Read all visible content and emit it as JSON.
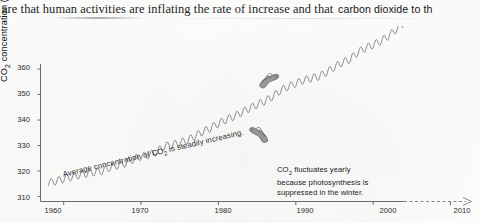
{
  "page": {
    "top_text_serif": "are that human activities are inflating the rate of increase and that",
    "top_text_sans": "carbon dioxide to th"
  },
  "chart_data": {
    "type": "line",
    "title": "",
    "xlabel": "",
    "ylabel": "CO2 concentration (parts per million)",
    "ylabel_main": "CO",
    "ylabel_sub": "2",
    "ylabel_rest": " concentration (parts per million)",
    "xlim": [
      1957,
      2012
    ],
    "ylim": [
      308,
      362
    ],
    "xticks": [
      "1960",
      "1970",
      "1980",
      "1990",
      "2000",
      "2010"
    ],
    "xtick_values": [
      1960,
      1970,
      1980,
      1990,
      2000,
      2010
    ],
    "yticks": [
      "310",
      "320",
      "330",
      "340",
      "350",
      "360"
    ],
    "ytick_values": [
      310,
      320,
      330,
      340,
      350,
      360
    ],
    "grid": false,
    "legend": "none",
    "line_color": "#8d8d8d",
    "axis_color": "#6f6f6f",
    "series": [
      {
        "name": "Mauna Loa CO2 (monthly, observed)",
        "x": [
          1958,
          1959,
          1960,
          1961,
          1962,
          1963,
          1964,
          1965,
          1966,
          1967,
          1968,
          1969,
          1970,
          1971,
          1972,
          1973,
          1974,
          1975,
          1976,
          1977,
          1978,
          1979,
          1980,
          1981,
          1982,
          1983,
          1984,
          1985,
          1986,
          1987,
          1988,
          1989,
          1990,
          1991,
          1992,
          1993,
          1994,
          1995,
          1996,
          1997,
          1998,
          1999,
          2000,
          2001,
          2002,
          2003
        ],
        "values": [
          315.3,
          316.0,
          316.9,
          317.6,
          318.4,
          319.0,
          319.6,
          320.0,
          321.4,
          322.2,
          323.0,
          324.6,
          325.7,
          326.3,
          327.5,
          329.7,
          330.2,
          331.1,
          332.0,
          333.8,
          335.4,
          336.8,
          338.7,
          340.1,
          341.4,
          343.0,
          344.6,
          346.0,
          347.4,
          349.2,
          351.6,
          353.1,
          354.4,
          355.6,
          356.4,
          357.1,
          358.8,
          360.8,
          362.6,
          363.8,
          366.6,
          368.3,
          369.5,
          371.0,
          373.1,
          375.6
        ],
        "seasonal_amplitude_ppm": 3.0,
        "style": "solid"
      },
      {
        "name": "Projected continuation",
        "x": [
          2004,
          2005,
          2006,
          2007
        ],
        "values": [
          377.4,
          379.6,
          381.8,
          383.7
        ],
        "seasonal_amplitude_ppm": 3.0,
        "style": "dotted-faded"
      }
    ],
    "annotations": [
      {
        "id": "trend-annotation",
        "text": "Average concentration of CO2 is steadily increasing.",
        "text_main": "Average concentration of CO",
        "text_sub": "2",
        "text_rest": " is steadily increasing.",
        "rotation_deg": -13.2,
        "pointer": "hand-pointing-icon"
      },
      {
        "id": "seasonal-annotation",
        "text": "CO2 fluctuates yearly because photosynthesis is suppressed in the winter.",
        "line1_main": "CO",
        "line1_sub": "2",
        "line1_rest": " fluctuates yearly",
        "line2": "because photosynthesis is",
        "line3": "suppressed in the winter.",
        "pointer": "hand-pointing-icon"
      }
    ],
    "axis_arrow": true
  }
}
